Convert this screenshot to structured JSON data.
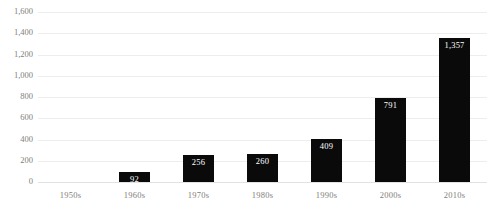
{
  "chart_data": {
    "type": "bar",
    "title": "",
    "xlabel": "",
    "ylabel": "",
    "categories": [
      "1950s",
      "1960s",
      "1970s",
      "1980s",
      "1990s",
      "2000s",
      "2010s"
    ],
    "values": [
      0,
      92,
      256,
      260,
      409,
      791,
      1357
    ],
    "value_labels": [
      "",
      "92",
      "256",
      "260",
      "409",
      "791",
      "1,357"
    ],
    "ylim": [
      0,
      1600
    ],
    "ytick_values": [
      0,
      200,
      400,
      600,
      800,
      1000,
      1200,
      1400,
      1600
    ],
    "ytick_labels": [
      "0",
      "200",
      "400",
      "600",
      "800",
      "1,000",
      "1,200",
      "1,400",
      "1,600"
    ],
    "grid": "horizontal",
    "legend": "none",
    "bar_color": "#0a0a0a",
    "data_label_color": "#ffffff",
    "axis_text_color": "#808080",
    "gridline_color": "#ededed",
    "background_color": "#ffffff"
  }
}
